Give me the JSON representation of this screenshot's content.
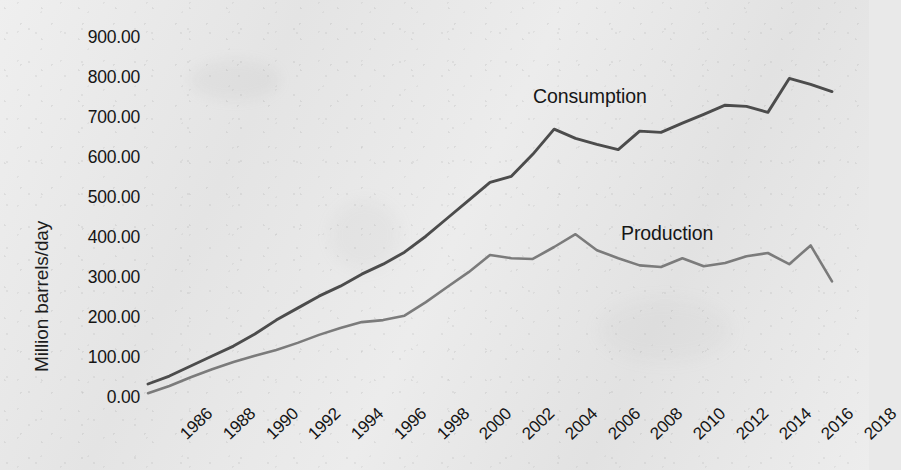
{
  "chart_data": {
    "type": "line",
    "title": "",
    "xlabel": "",
    "ylabel": "Million barrels/day",
    "x": [
      1986,
      1987,
      1988,
      1989,
      1990,
      1991,
      1992,
      1993,
      1994,
      1995,
      1996,
      1997,
      1998,
      1999,
      2000,
      2001,
      2002,
      2003,
      2004,
      2005,
      2006,
      2007,
      2008,
      2009,
      2010,
      2011,
      2012,
      2013,
      2014,
      2015,
      2016,
      2017,
      2018
    ],
    "x_tick_labels": [
      "1986",
      "1988",
      "1990",
      "1992",
      "1994",
      "1996",
      "1998",
      "2000",
      "2002",
      "2004",
      "2006",
      "2008",
      "2010",
      "2012",
      "2014",
      "2016",
      "2018"
    ],
    "y_tick_labels": [
      "900.00",
      "800.00",
      "700.00",
      "600.00",
      "500.00",
      "400.00",
      "300.00",
      "200.00",
      "100.00",
      "0.00"
    ],
    "y_ticks": [
      900,
      800,
      700,
      600,
      500,
      400,
      300,
      200,
      100,
      0
    ],
    "ylim": [
      0,
      900
    ],
    "xlim": [
      1986,
      2018
    ],
    "grid": false,
    "legend_position": "inline-annotation",
    "series": [
      {
        "name": "Consumption",
        "color": "#4c4c4c",
        "values": [
          25,
          45,
          70,
          95,
          120,
          150,
          185,
          215,
          245,
          270,
          300,
          325,
          355,
          395,
          440,
          485,
          530,
          545,
          600,
          663,
          640,
          625,
          612,
          658,
          655,
          678,
          700,
          723,
          720,
          705,
          790,
          775,
          757
        ]
      },
      {
        "name": "Production",
        "color": "#7b7b7b",
        "values": [
          2,
          20,
          42,
          62,
          80,
          96,
          110,
          128,
          148,
          165,
          180,
          185,
          196,
          230,
          268,
          305,
          348,
          340,
          338,
          368,
          400,
          360,
          340,
          322,
          318,
          340,
          320,
          328,
          345,
          353,
          325,
          372,
          282
        ]
      }
    ],
    "annotations": [
      {
        "text": "Consumption",
        "x": 2004,
        "y": 745
      },
      {
        "text": "Production",
        "x": 2012,
        "y": 430
      }
    ]
  },
  "axes": {
    "y_title": "Million barrels/day"
  }
}
